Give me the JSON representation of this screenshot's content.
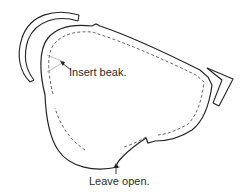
{
  "diagram": {
    "type": "sewing-pattern",
    "colors": {
      "outline": "#222222",
      "seam": "#555555",
      "leader": "#999999",
      "background": "#ffffff"
    },
    "annotations": [
      {
        "id": "insert-beak",
        "text": "Insert beak."
      },
      {
        "id": "leave-open",
        "text": "Leave open."
      }
    ],
    "parts": [
      {
        "id": "body",
        "description": "main body outline with dashed seam allowance"
      },
      {
        "id": "wing-arc",
        "description": "double-line crescent piece at top-left"
      },
      {
        "id": "tail-chevron",
        "description": "double-line chevron at right tip"
      }
    ]
  }
}
